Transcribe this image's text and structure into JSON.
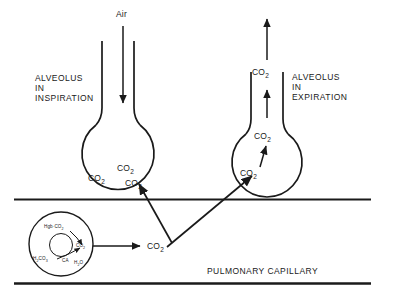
{
  "diagram": {
    "title_text": "PULMONARY CAPILLARY",
    "colors": {
      "stroke": "#1a1a1a",
      "text": "#1a1a1a",
      "background": "#ffffff"
    },
    "air_label": "Air",
    "left_alveolus": {
      "label_line1": "ALVEOLUS",
      "label_line2": "IN",
      "label_line3": "INSPIRATION",
      "gas_1": "CO",
      "gas_1_sub": "2",
      "gas_2": "CO",
      "gas_2_sub": "2",
      "gas_3": "CO",
      "gas_3_sub": "2"
    },
    "right_alveolus": {
      "label_line1": "ALVEOLUS",
      "label_line2": "IN",
      "label_line3": "EXPIRATION",
      "gas_duct": "CO",
      "gas_duct_sub": "2",
      "gas_upper": "CO",
      "gas_upper_sub": "2",
      "gas_lower": "CO",
      "gas_lower_sub": "2"
    },
    "capillary": {
      "label": "PULMONARY CAPILLARY",
      "free_gas": "CO",
      "free_gas_sub": "2"
    },
    "red_blood_cell": {
      "carbamino": "Hgb",
      "carbamino_dot": "·",
      "carbamino_gas": "CO",
      "carbamino_gas_sub": "2",
      "dissolved_gas": "CO",
      "dissolved_gas_sub": "2",
      "carbonic_acid": "H",
      "carbonic_acid_sub1": "2",
      "carbonic_acid_mid": "CO",
      "carbonic_acid_sub2": "3",
      "enzyme": "CA",
      "water": "H",
      "water_sub": "2",
      "water_rest": "O"
    }
  }
}
